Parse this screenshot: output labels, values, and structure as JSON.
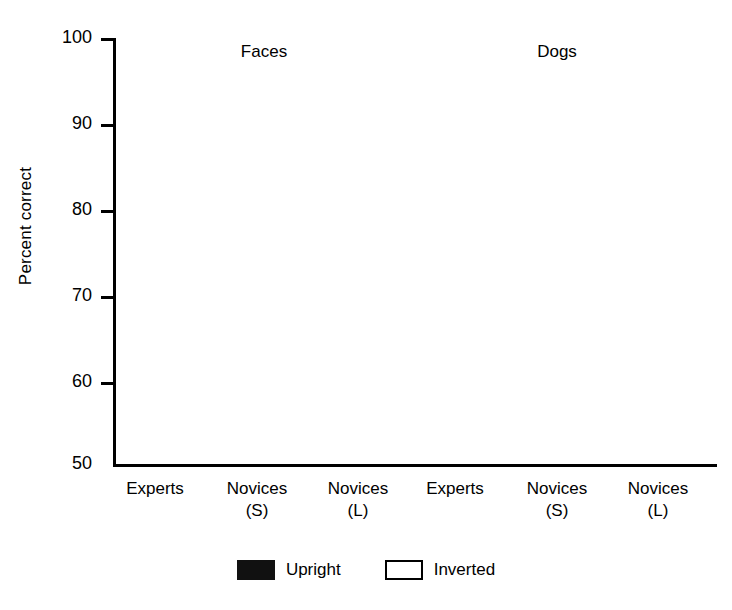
{
  "chart_data": {
    "type": "bar",
    "title": "",
    "xlabel": "",
    "ylabel": "Percent correct",
    "ylim": [
      50,
      100
    ],
    "yticks": [
      50,
      60,
      70,
      80,
      90,
      100
    ],
    "ytick_labels": [
      "50",
      "60",
      "70",
      "80",
      "90",
      "100"
    ],
    "grid": false,
    "legend_position": "bottom-center",
    "panels": [
      {
        "name": "Faces",
        "categories": [
          "Experts",
          "Novices\n(S)",
          "Novices\n(L)"
        ],
        "series": [
          {
            "name": "Upright",
            "values": [
              81.5,
              94.3,
              89.0
            ]
          },
          {
            "name": "Inverted",
            "values": [
              61.3,
              68.0,
              66.0
            ]
          }
        ]
      },
      {
        "name": "Dogs",
        "categories": [
          "Experts",
          "Novices\n(S)",
          "Novices\n(L)"
        ],
        "series": [
          {
            "name": "Upright",
            "values": [
              81.1,
              78.8,
              72.8
            ]
          },
          {
            "name": "Inverted",
            "values": [
              58.8,
              81.1,
              70.7
            ]
          }
        ]
      }
    ],
    "series_names": [
      "Upright",
      "Inverted"
    ],
    "series_colors": [
      "#111111",
      "#ffffff"
    ]
  },
  "axis": {
    "ylabel": "Percent correct",
    "ticks": [
      {
        "value": 100,
        "label": "100"
      },
      {
        "value": 90,
        "label": "90"
      },
      {
        "value": 80,
        "label": "80"
      },
      {
        "value": 70,
        "label": "70"
      },
      {
        "value": 60,
        "label": "60"
      },
      {
        "value": 50,
        "label": "50"
      }
    ]
  },
  "panels": {
    "faces_title": "Faces",
    "dogs_title": "Dogs"
  },
  "xlabels": {
    "faces": [
      {
        "line1": "Experts",
        "line2": ""
      },
      {
        "line1": "Novices",
        "line2": "(S)"
      },
      {
        "line1": "Novices",
        "line2": "(L)"
      }
    ],
    "dogs": [
      {
        "line1": "Experts",
        "line2": ""
      },
      {
        "line1": "Novices",
        "line2": "(S)"
      },
      {
        "line1": "Novices",
        "line2": "(L)"
      }
    ]
  },
  "legend": {
    "items": [
      {
        "label": "Upright",
        "style": "filled",
        "color": "#111111"
      },
      {
        "label": "Inverted",
        "style": "open",
        "color": "#ffffff"
      }
    ]
  }
}
